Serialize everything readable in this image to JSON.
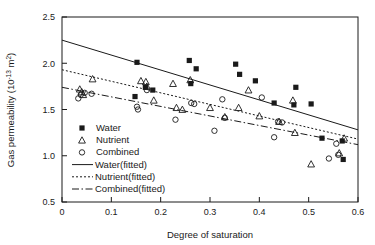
{
  "chart_data": {
    "type": "scatter",
    "title": "",
    "xlabel": "Degree of saturation",
    "ylabel_text": "Gas permeability (10",
    "ylabel_exp": "-13",
    "ylabel_tail": " m",
    "ylabel_tail_exp": "2",
    "ylabel_close": ")",
    "ylabel_full": "Gas permeability (10-13 m2)",
    "xlim": [
      0,
      0.6
    ],
    "ylim": [
      0.5,
      2.5
    ],
    "xticks": [
      0,
      0.1,
      0.2,
      0.3,
      0.4,
      0.5,
      0.6
    ],
    "xtick_labels": [
      "0",
      "0.1",
      "0.2",
      "0.3",
      "0.4",
      "0.5",
      "0.6"
    ],
    "yticks": [
      0.5,
      1.0,
      1.5,
      2.0,
      2.5
    ],
    "ytick_labels": [
      "0.5",
      "1.0",
      "1.5",
      "2.0",
      "2.5"
    ],
    "grid": false,
    "legend_position": "lower-left-inside",
    "series": [
      {
        "name": "Water",
        "marker": "filled-square",
        "points": [
          [
            0.152,
            2.01
          ],
          [
            0.148,
            1.64
          ],
          [
            0.169,
            1.74
          ],
          [
            0.184,
            1.71
          ],
          [
            0.258,
            2.03
          ],
          [
            0.261,
            1.78
          ],
          [
            0.272,
            1.94
          ],
          [
            0.352,
            1.99
          ],
          [
            0.36,
            1.88
          ],
          [
            0.392,
            1.81
          ],
          [
            0.43,
            1.57
          ],
          [
            0.47,
            1.55
          ],
          [
            0.474,
            1.74
          ],
          [
            0.505,
            1.56
          ],
          [
            0.527,
            1.19
          ],
          [
            0.568,
            1.16
          ],
          [
            0.57,
            0.96
          ]
        ]
      },
      {
        "name": "Nutrient",
        "marker": "open-triangle",
        "points": [
          [
            0.036,
            1.72
          ],
          [
            0.04,
            1.69
          ],
          [
            0.043,
            1.66
          ],
          [
            0.062,
            1.83
          ],
          [
            0.16,
            1.81
          ],
          [
            0.17,
            1.8
          ],
          [
            0.172,
            1.75
          ],
          [
            0.186,
            1.6
          ],
          [
            0.225,
            1.78
          ],
          [
            0.232,
            1.52
          ],
          [
            0.244,
            1.5
          ],
          [
            0.26,
            1.82
          ],
          [
            0.3,
            1.52
          ],
          [
            0.33,
            1.42
          ],
          [
            0.358,
            1.52
          ],
          [
            0.378,
            1.71
          ],
          [
            0.4,
            1.43
          ],
          [
            0.44,
            1.37
          ],
          [
            0.468,
            1.6
          ],
          [
            0.472,
            1.25
          ],
          [
            0.505,
            0.91
          ],
          [
            0.562,
            1.03
          ],
          [
            0.572,
            1.19
          ]
        ]
      },
      {
        "name": "Combined",
        "marker": "open-circle",
        "points": [
          [
            0.033,
            1.62
          ],
          [
            0.038,
            1.66
          ],
          [
            0.046,
            1.68
          ],
          [
            0.06,
            1.67
          ],
          [
            0.152,
            1.53
          ],
          [
            0.154,
            1.5
          ],
          [
            0.172,
            1.71
          ],
          [
            0.23,
            1.39
          ],
          [
            0.262,
            1.57
          ],
          [
            0.268,
            1.56
          ],
          [
            0.309,
            1.27
          ],
          [
            0.325,
            1.61
          ],
          [
            0.33,
            1.41
          ],
          [
            0.405,
            1.63
          ],
          [
            0.43,
            1.2
          ],
          [
            0.438,
            1.37
          ],
          [
            0.446,
            1.36
          ],
          [
            0.541,
            0.97
          ],
          [
            0.556,
            1.13
          ],
          [
            0.56,
            1.01
          ]
        ]
      }
    ],
    "fits": [
      {
        "name": "Water(fitted)",
        "style": "solid",
        "x": [
          0,
          0.6
        ],
        "y": [
          2.25,
          1.28
        ]
      },
      {
        "name": "Nutrient(fitted)",
        "style": "dotted",
        "x": [
          0,
          0.6
        ],
        "y": [
          1.93,
          1.18
        ]
      },
      {
        "name": "Combined(fitted)",
        "style": "dashdot",
        "x": [
          0,
          0.6
        ],
        "y": [
          1.74,
          1.12
        ]
      }
    ],
    "legend_entries": [
      {
        "label": "Water",
        "kind": "marker",
        "marker": "filled-square"
      },
      {
        "label": "Nutrient",
        "kind": "marker",
        "marker": "open-triangle"
      },
      {
        "label": "Combined",
        "kind": "marker",
        "marker": "open-circle"
      },
      {
        "label": "Water(fitted)",
        "kind": "line",
        "style": "solid"
      },
      {
        "label": "Nutrient(fitted)",
        "kind": "line",
        "style": "dotted"
      },
      {
        "label": "Combined(fitted)",
        "kind": "line",
        "style": "dashdot"
      }
    ],
    "colors": {
      "ink": "#1a1a1a",
      "background": "#ffffff"
    }
  }
}
